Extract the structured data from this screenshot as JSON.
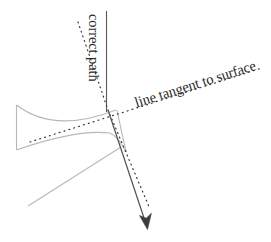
{
  "figure": {
    "width": 271,
    "height": 242,
    "background_color": "#ffffff",
    "labels": {
      "correct_path": "correct path",
      "tangent_line": "line tangent to surface"
    },
    "colors": {
      "surface": "#b8b8b8",
      "text": "#2b2b2b",
      "solid_line": "#4a4a4a",
      "dotted_line": "#3a3a3a",
      "vertical_line": "#585858"
    }
  },
  "geometry": {
    "intersection_point": {
      "x": 108,
      "y": 110
    },
    "vertical_correct_path": {
      "x": 106,
      "y_top": 11,
      "y_bottom": 112
    },
    "tangent_dotted_line": {
      "x1": 30,
      "y1": 142,
      "x2": 262,
      "y2": 68
    },
    "upper_dotted_line": {
      "x1": 78,
      "y1": 22,
      "x2": 108,
      "y2": 110
    },
    "lower_dotted_line": {
      "x1": 108,
      "y1": 110,
      "x2": 150,
      "y2": 209
    },
    "solid_arrow": {
      "x1": 108,
      "y1": 110,
      "x2": 147,
      "y2": 228
    },
    "surface_left_edge": {
      "x": 16,
      "y_top": 105,
      "y_bottom": 150
    },
    "surface_upper_curve": {
      "x1": 16,
      "y1": 105,
      "x2": 116,
      "y2": 110
    },
    "surface_lower_curve": {
      "x1": 16,
      "y1": 150,
      "x2": 126,
      "y2": 152
    },
    "surface_diagonal": {
      "x1": 28,
      "y1": 206,
      "x2": 121,
      "y2": 147
    },
    "surface_right_stem": {
      "x1": 117,
      "y1": 110,
      "x2": 126,
      "y2": 152
    }
  }
}
